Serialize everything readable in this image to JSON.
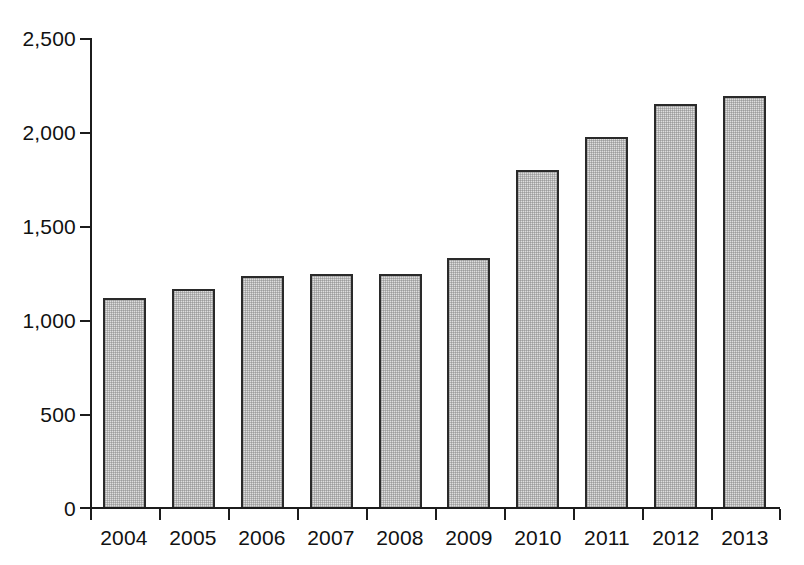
{
  "chart_data": {
    "type": "bar",
    "title": "",
    "subtitle": "",
    "xlabel": "",
    "ylabel": "",
    "categories": [
      "2004",
      "2005",
      "2006",
      "2007",
      "2008",
      "2009",
      "2010",
      "2011",
      "2012",
      "2013"
    ],
    "values": [
      1120,
      1170,
      1235,
      1250,
      1250,
      1335,
      1800,
      1975,
      2150,
      2195
    ],
    "series": [
      {
        "name": "",
        "values": [
          1120,
          1170,
          1235,
          1250,
          1250,
          1335,
          1800,
          1975,
          2150,
          2195
        ]
      }
    ],
    "ylim": [
      0,
      2500
    ],
    "ytick_values": [
      0,
      500,
      1000,
      1500,
      2000,
      2500
    ],
    "ytick_labels": [
      "0",
      "500",
      "1,000",
      "1,500",
      "2,000",
      "2,500"
    ],
    "grid": false,
    "legend": null,
    "legend_position": "none",
    "annotations": [],
    "bar_fill_color": "#dedede",
    "bar_border_color": "#2a2a2a",
    "axis_color": "#1c1c1c",
    "background_color": "#ffffff",
    "text_color": "#111111"
  }
}
